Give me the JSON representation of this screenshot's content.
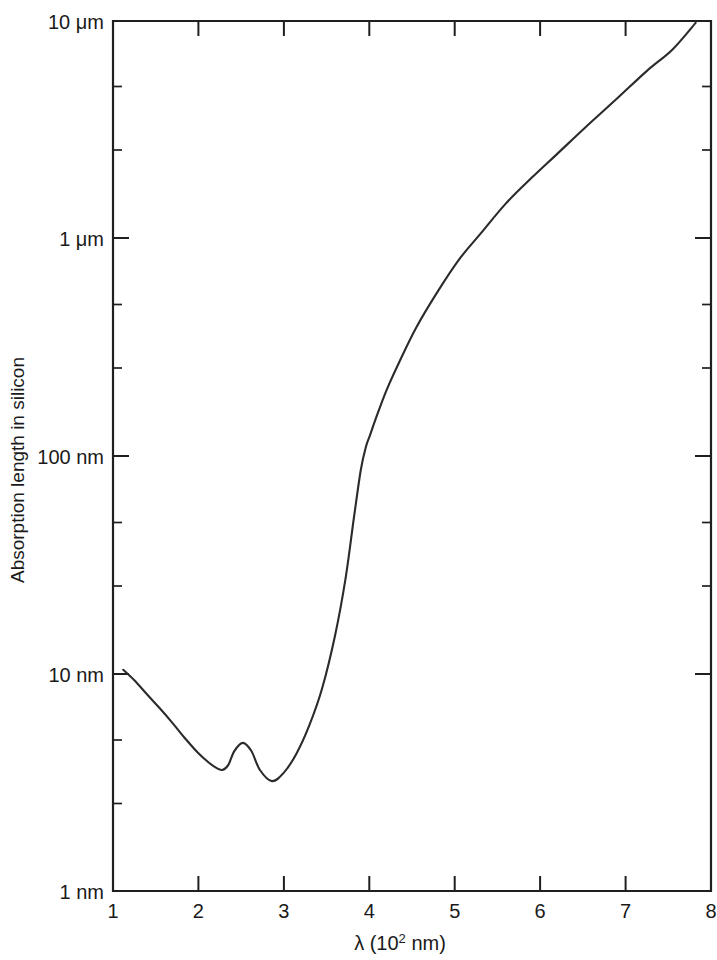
{
  "chart_data": {
    "type": "line",
    "title": "",
    "xlabel": "λ (10² nm)",
    "ylabel": "Absorption length in silicon",
    "xlabel_base": "λ (10",
    "xlabel_exponent": "2",
    "xlabel_tail": " nm)",
    "xscale": "linear",
    "yscale": "log",
    "xlim": [
      1,
      8
    ],
    "ylim_nm": [
      1,
      10000
    ],
    "grid": false,
    "legend": null,
    "x_ticks": [
      1,
      2,
      3,
      4,
      5,
      6,
      7,
      8
    ],
    "x_tick_labels": [
      "1",
      "2",
      "3",
      "4",
      "5",
      "6",
      "7",
      "8"
    ],
    "y_ticks_nm": [
      1,
      10,
      100,
      1000,
      10000
    ],
    "y_tick_labels": [
      "1 nm",
      "10 nm",
      "100 nm",
      "1 μm",
      "10 μm"
    ],
    "y_minor_ticks_nm": [
      2,
      3,
      4,
      5,
      6,
      7,
      8,
      9,
      20,
      30,
      40,
      50,
      60,
      70,
      80,
      90,
      200,
      300,
      400,
      500,
      600,
      700,
      800,
      900,
      2000,
      3000,
      4000,
      5000,
      6000,
      7000,
      8000,
      9000
    ],
    "series": [
      {
        "name": "Absorption length in silicon",
        "x_unit": "10^2 nm",
        "y_unit": "nm",
        "x": [
          1.12,
          1.25,
          1.4,
          1.55,
          1.7,
          1.85,
          2.0,
          2.12,
          2.2,
          2.28,
          2.35,
          2.42,
          2.52,
          2.62,
          2.72,
          2.86,
          3.0,
          3.15,
          3.3,
          3.45,
          3.6,
          3.72,
          3.82,
          3.9,
          3.96,
          4.01,
          4.08,
          4.2,
          4.35,
          4.55,
          4.8,
          5.05,
          5.3,
          5.6,
          5.9,
          6.2,
          6.55,
          6.9,
          7.25,
          7.55,
          7.82
        ],
        "y": [
          10.4,
          9.3,
          8.0,
          6.9,
          5.9,
          5.0,
          4.3,
          3.9,
          3.7,
          3.6,
          3.8,
          4.4,
          4.8,
          4.4,
          3.6,
          3.2,
          3.5,
          4.3,
          5.8,
          8.6,
          15.0,
          27.0,
          52.0,
          86.0,
          110.0,
          125.0,
          150.0,
          200.0,
          270.0,
          390.0,
          570.0,
          800.0,
          1050.0,
          1450.0,
          1900.0,
          2450.0,
          3300.0,
          4400.0,
          5900.0,
          7400.0,
          9800.0
        ]
      }
    ],
    "annotations": []
  },
  "figure": {
    "background_color": "#ffffff",
    "curve_color": "#2b2b2b",
    "axis_color": "#1f1f1f"
  }
}
